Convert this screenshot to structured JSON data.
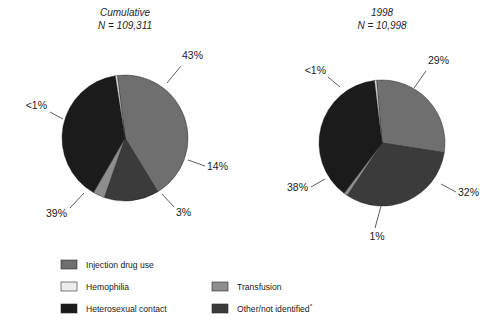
{
  "figure": {
    "background": "#ffffff"
  },
  "chart_data": [
    {
      "type": "pie",
      "title": "Cumulative",
      "subtitle": "N = 109,311",
      "n_label": "N = 109,311",
      "categories": [
        "Injection drug use",
        "Other/not identified",
        "Transfusion",
        "Heterosexual contact",
        "Hemophilia"
      ],
      "values": [
        43,
        14,
        3,
        39,
        0.5
      ],
      "data_labels": [
        "43%",
        "14%",
        "3%",
        "39%",
        "<1%"
      ],
      "colors": [
        "#6f6f6f",
        "#3b3b3b",
        "#8d8d8d",
        "#1b1b1b",
        "#e8e8e8"
      ],
      "start_angle_deg": -7,
      "direction": "clockwise",
      "legend": "below"
    },
    {
      "type": "pie",
      "title": "1998",
      "subtitle": "N = 10,998",
      "n_label": "N = 10,998",
      "categories": [
        "Injection drug use",
        "Other/not identified",
        "Transfusion",
        "Heterosexual contact",
        "Hemophilia"
      ],
      "values": [
        29,
        32,
        1,
        38,
        0.5
      ],
      "data_labels": [
        "29%",
        "32%",
        "1%",
        "38%",
        "<1%"
      ],
      "colors": [
        "#6f6f6f",
        "#3b3b3b",
        "#8d8d8d",
        "#1b1b1b",
        "#e8e8e8"
      ],
      "start_angle_deg": -5,
      "direction": "clockwise",
      "legend": "below"
    }
  ],
  "charts": {
    "left": {
      "title": "Cumulative",
      "n_label": "N = 109,311",
      "labels": {
        "injection": "43%",
        "other": "14%",
        "transfusion": "3%",
        "heterosexual": "39%",
        "hemophilia": "<1%"
      }
    },
    "right": {
      "title": "1998",
      "n_label": "N = 10,998",
      "labels": {
        "injection": "29%",
        "other": "32%",
        "transfusion": "1%",
        "heterosexual": "38%",
        "hemophilia": "<1%"
      }
    }
  },
  "legend": {
    "items": [
      {
        "label": "Injection drug use",
        "color": "#6f6f6f"
      },
      {
        "label": "Hemophilia",
        "color": "#ececec"
      },
      {
        "label": "Heterosexual contact",
        "color": "#1b1b1b"
      },
      {
        "label": "Transfusion",
        "color": "#8d8d8d"
      },
      {
        "label": "Other/not identified",
        "color": "#3b3b3b",
        "footnote_marker": "*"
      }
    ]
  }
}
